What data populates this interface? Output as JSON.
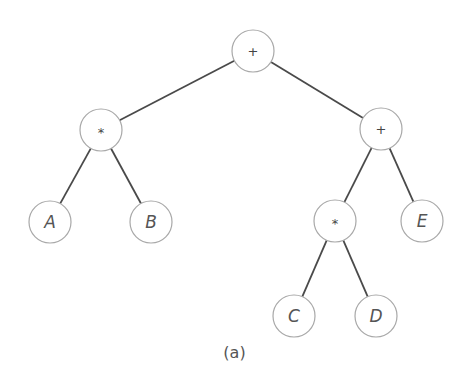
{
  "diagram": {
    "type": "expression-tree",
    "caption": "(a)",
    "colors": {
      "background": "#ffffff",
      "edge": "#4a4a4a",
      "node_stroke": "#a8a8a8",
      "text": "#555555"
    },
    "node_radius": 21,
    "nodes": [
      {
        "id": "root",
        "label": "+",
        "kind": "operator",
        "x": 253,
        "y": 51
      },
      {
        "id": "mul1",
        "label": "*",
        "kind": "operator",
        "x": 101,
        "y": 130
      },
      {
        "id": "plus2",
        "label": "+",
        "kind": "operator",
        "x": 381,
        "y": 129
      },
      {
        "id": "A",
        "label": "A",
        "kind": "operand",
        "x": 50,
        "y": 222
      },
      {
        "id": "B",
        "label": "B",
        "kind": "operand",
        "x": 151,
        "y": 222
      },
      {
        "id": "mul2",
        "label": "*",
        "kind": "operator",
        "x": 335,
        "y": 221
      },
      {
        "id": "E",
        "label": "E",
        "kind": "operand",
        "x": 422,
        "y": 221
      },
      {
        "id": "C",
        "label": "C",
        "kind": "operand",
        "x": 294,
        "y": 316
      },
      {
        "id": "D",
        "label": "D",
        "kind": "operand",
        "x": 376,
        "y": 316
      }
    ],
    "edges": [
      {
        "from": "root",
        "to": "mul1"
      },
      {
        "from": "root",
        "to": "plus2"
      },
      {
        "from": "mul1",
        "to": "A"
      },
      {
        "from": "mul1",
        "to": "B"
      },
      {
        "from": "plus2",
        "to": "mul2"
      },
      {
        "from": "plus2",
        "to": "E"
      },
      {
        "from": "mul2",
        "to": "C"
      },
      {
        "from": "mul2",
        "to": "D"
      }
    ]
  }
}
